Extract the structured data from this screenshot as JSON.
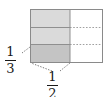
{
  "figure": {
    "type": "area-model",
    "colors": {
      "light_shade": "#d9d9d9",
      "dark_shade": "#c0c0c0",
      "unshaded": "#ffffff",
      "outline": "#808080",
      "grid_solid": "#8c8c8c",
      "grid_dotted": "#9a9a9a",
      "leader": "#4d4d4d",
      "text": "#1a1a1a"
    },
    "rectangle": {
      "x": 30,
      "y": 9,
      "width": 73,
      "height": 54,
      "columns": 2,
      "rows": 3
    },
    "shaded_region": {
      "description": "left column shaded",
      "x": 30,
      "y": 9,
      "width": 40,
      "height": 54
    },
    "highlight_cell": {
      "description": "bottom-left cell darker",
      "x": 30,
      "y": 44,
      "width": 40,
      "height": 19
    },
    "grid_lines": {
      "horizontal_y": [
        27,
        44
      ],
      "vertical_x": [
        70
      ]
    }
  },
  "labels": {
    "vertical_fraction": {
      "name": "one-third",
      "numerator": "1",
      "denominator": "3",
      "value": 0.3333
    },
    "horizontal_fraction": {
      "name": "one-half",
      "numerator": "1",
      "denominator": "2",
      "value": 0.5
    }
  }
}
